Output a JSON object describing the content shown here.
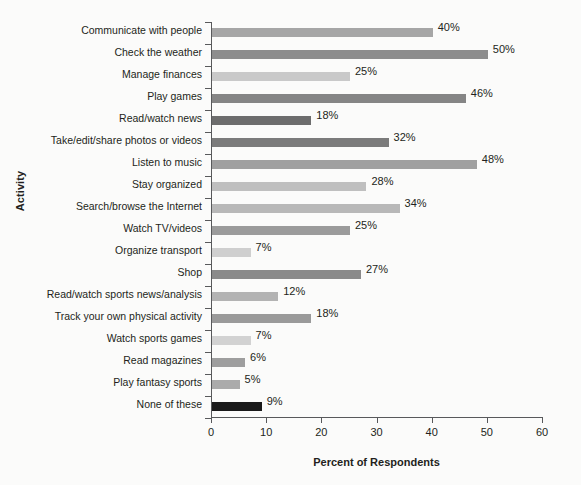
{
  "chart_data": {
    "type": "bar",
    "orientation": "horizontal",
    "title": "",
    "xlabel": "Percent of Respondents",
    "ylabel": "Activity",
    "xlim": [
      0,
      60
    ],
    "xticks": [
      0,
      10,
      20,
      30,
      40,
      50,
      60
    ],
    "grid": false,
    "legend": null,
    "value_suffix": "%",
    "categories": [
      "Communicate with people",
      "Check the weather",
      "Manage finances",
      "Play games",
      "Read/watch news",
      "Take/edit/share photos or videos",
      "Listen to music",
      "Stay organized",
      "Search/browse the Internet",
      "Watch TV/videos",
      "Organize transport",
      "Shop",
      "Read/watch sports news/analysis",
      "Track your own physical activity",
      "Watch sports games",
      "Read magazines",
      "Play fantasy sports",
      "None of these"
    ],
    "values": [
      40,
      50,
      25,
      46,
      18,
      32,
      48,
      28,
      34,
      25,
      7,
      27,
      12,
      18,
      7,
      6,
      5,
      9
    ],
    "value_labels": [
      "40%",
      "50%",
      "25%",
      "46%",
      "18%",
      "32%",
      "48%",
      "28%",
      "34%",
      "25%",
      "7%",
      "27%",
      "12%",
      "18%",
      "7%",
      "6%",
      "5%",
      "9%"
    ],
    "bar_colors": [
      "#a6a6a6",
      "#8d8d8d",
      "#c9c9c9",
      "#858585",
      "#6d6d6d",
      "#7b7b7b",
      "#a0a0a0",
      "#bfbfbf",
      "#b8b8b8",
      "#9b9b9b",
      "#cfcfcf",
      "#8a8a8a",
      "#b3b3b3",
      "#9a9a9a",
      "#d2d2d2",
      "#9e9e9e",
      "#ababab",
      "#1a1a1a"
    ]
  },
  "colors": {
    "background": "#fbfbfa",
    "axis": "#58595b",
    "text": "#231f20"
  }
}
